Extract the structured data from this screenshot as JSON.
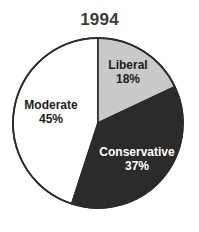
{
  "chart_data": {
    "type": "pie",
    "title": "1994",
    "xlabel": "",
    "ylabel": "",
    "legend": "none",
    "grid": false,
    "start_angle_deg": 90,
    "direction": "clockwise",
    "categories": [
      "Liberal",
      "Conservative",
      "Moderate"
    ],
    "values": [
      18,
      37,
      45
    ],
    "value_labels": [
      "18%",
      "37%",
      "45%"
    ],
    "units": "percent",
    "slices": [
      {
        "label": "Liberal",
        "value": 18,
        "value_label": "18%",
        "color": "#c9c9c9",
        "text_color": "#1d1d1d",
        "start_deg": 0,
        "sweep_deg": 64.8
      },
      {
        "label": "Conservative",
        "value": 37,
        "value_label": "37%",
        "color": "#2b2b2b",
        "text_color": "#ffffff",
        "start_deg": 64.8,
        "sweep_deg": 133.2
      },
      {
        "label": "Moderate",
        "value": 45,
        "value_label": "45%",
        "color": "#ffffff",
        "text_color": "#1d1d1d",
        "start_deg": 198.0,
        "sweep_deg": 162.0
      }
    ],
    "outline_color": "#2b2b2b",
    "background": "#ffffff",
    "title_color": "#3b3b3b"
  }
}
